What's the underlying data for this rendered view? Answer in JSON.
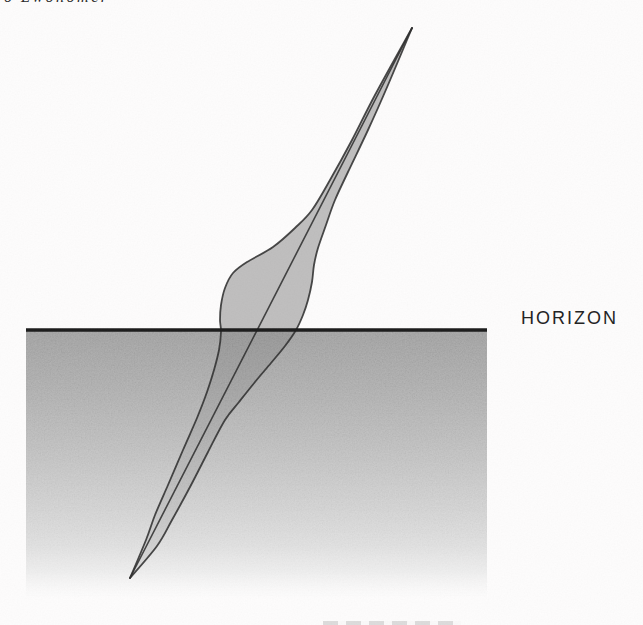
{
  "meta": {
    "width": 643,
    "height": 625
  },
  "labels": {
    "horizon": "HORIZON",
    "top_fragment": "o Lwonomer"
  },
  "figure": {
    "type": "diagram",
    "horizon_y": 330,
    "horizon_x1": 26,
    "horizon_x2": 487,
    "ground": {
      "x": 26,
      "y": 331,
      "width": 461,
      "height": 268
    },
    "apex_top": [
      412,
      28
    ],
    "apex_bottom": [
      130,
      578
    ],
    "axis": [
      [
        412,
        28
      ],
      [
        130,
        578
      ]
    ],
    "left_edge": [
      [
        412,
        28
      ],
      [
        375,
        95
      ],
      [
        352,
        140
      ],
      [
        330,
        180
      ],
      [
        312,
        210
      ],
      [
        295,
        228
      ],
      [
        273,
        247
      ],
      [
        247,
        262
      ],
      [
        233,
        273
      ],
      [
        225,
        288
      ],
      [
        221,
        305
      ],
      [
        220,
        320
      ],
      [
        221,
        332
      ],
      [
        219,
        350
      ],
      [
        214,
        370
      ],
      [
        207,
        392
      ],
      [
        197,
        418
      ],
      [
        183,
        450
      ],
      [
        168,
        485
      ],
      [
        155,
        515
      ],
      [
        146,
        540
      ],
      [
        130,
        578
      ]
    ],
    "right_edge": [
      [
        412,
        28
      ],
      [
        388,
        85
      ],
      [
        368,
        130
      ],
      [
        348,
        172
      ],
      [
        335,
        200
      ],
      [
        326,
        225
      ],
      [
        318,
        248
      ],
      [
        314,
        265
      ],
      [
        312,
        282
      ],
      [
        308,
        300
      ],
      [
        303,
        315
      ],
      [
        296,
        330
      ],
      [
        285,
        346
      ],
      [
        271,
        363
      ],
      [
        255,
        382
      ],
      [
        239,
        402
      ],
      [
        225,
        420
      ],
      [
        208,
        452
      ],
      [
        190,
        487
      ],
      [
        172,
        520
      ],
      [
        157,
        546
      ],
      [
        130,
        578
      ]
    ],
    "colors": {
      "ink": "#2b2b2b",
      "horizon_line": "#171717",
      "fill_alpha_above": 0.25,
      "fill_alpha_below": 0.07,
      "ground_stops": [
        {
          "o": 0,
          "c": "#a0a0a0",
          "a": 1
        },
        {
          "o": 0.18,
          "c": "#adadad",
          "a": 1
        },
        {
          "o": 0.4,
          "c": "#bfbfbf",
          "a": 1
        },
        {
          "o": 0.62,
          "c": "#d3d3d3",
          "a": 1
        },
        {
          "o": 0.8,
          "c": "#e4e4e4",
          "a": 1
        },
        {
          "o": 0.9,
          "c": "#efefef",
          "a": 0.85
        },
        {
          "o": 1,
          "c": "#f8f8f8",
          "a": 0
        }
      ]
    }
  }
}
